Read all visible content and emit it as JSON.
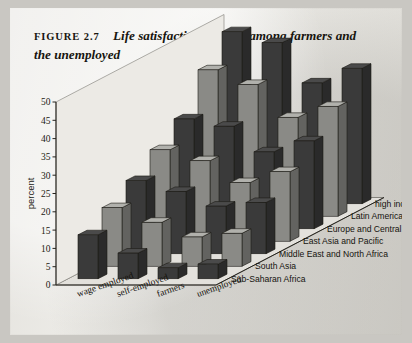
{
  "figure": {
    "tag": "FIGURE 2.7",
    "title": "Life satisfaction is lower among farmers and the unemployed"
  },
  "chart_data": {
    "type": "bar",
    "title": "Life satisfaction is lower among farmers and the unemployed",
    "subtitle": "",
    "xlabel": "",
    "ylabel": "percent",
    "ylim": [
      0,
      50
    ],
    "yticks": [
      0,
      5,
      10,
      15,
      20,
      25,
      30,
      35,
      40,
      45,
      50
    ],
    "grid": false,
    "legend_position": "right-depth-axis",
    "projection": "3d",
    "categories": [
      "wage employed",
      "self-employed",
      "farmers",
      "unemployed"
    ],
    "series": [
      {
        "name": "Sub-Saharan Africa",
        "values": [
          12,
          7,
          3,
          4
        ]
      },
      {
        "name": "South Asia",
        "values": [
          16,
          12,
          8,
          9
        ]
      },
      {
        "name": "Middle East and North Africa",
        "values": [
          20,
          17,
          13,
          14
        ]
      },
      {
        "name": "East Asia and Pacific",
        "values": [
          25,
          22,
          16,
          19
        ]
      },
      {
        "name": "Europe and Central Asia",
        "values": [
          30,
          28,
          21,
          24
        ]
      },
      {
        "name": "Latin America and the Caribbean",
        "values": [
          40,
          36,
          27,
          30
        ]
      },
      {
        "name": "high income",
        "values": [
          47,
          44,
          33,
          37
        ]
      }
    ],
    "series_colors": [
      "#3a3a3a",
      "#8a8a86",
      "#3a3a3a",
      "#8a8a86",
      "#3a3a3a",
      "#8a8a86",
      "#3a3a3a"
    ]
  },
  "axis": {
    "y_label": "percent",
    "y_ticks": [
      "0",
      "5",
      "10",
      "15",
      "20",
      "25",
      "30",
      "35",
      "40",
      "45",
      "50"
    ],
    "category_labels": [
      "wage employed",
      "self-employed",
      "farmers",
      "unemployed"
    ],
    "depth_labels": [
      "high income",
      "Latin America and the Caribbean",
      "Europe and Central Asia",
      "East Asia and Pacific",
      "Middle East and North Africa",
      "South Asia",
      "Sub-Saharan Africa"
    ]
  }
}
